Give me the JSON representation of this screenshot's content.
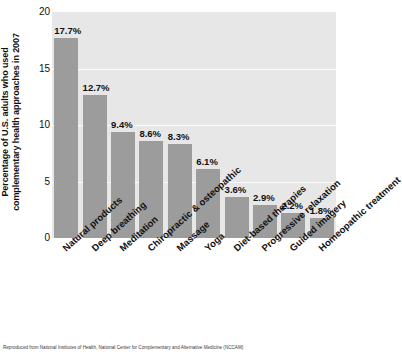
{
  "chart_data": {
    "type": "bar",
    "title": "",
    "subtitle": "",
    "xlabel": "",
    "ylabel_line1": "Percentage of U.S. adults who used",
    "ylabel_line2": "complementary health approaches in 2007",
    "ylim": [
      0,
      20
    ],
    "yticks": [
      0,
      5,
      10,
      15,
      20
    ],
    "ytick_labels": [
      "0",
      "5",
      "10",
      "15",
      "20"
    ],
    "grid": "horizontal-white-gridlines",
    "legend": "none",
    "orientation": "vertical",
    "bar_color": "#9c9c9c",
    "plot_background": "#e7e7e7",
    "categories": [
      "Natural products",
      "Deep breathing",
      "Meditation",
      "Chiropractic & osteopathic",
      "Massage",
      "Yoga",
      "Diet-based therapies",
      "Progressive relaxation",
      "Guided imagery",
      "Homeopathic treatment"
    ],
    "values": [
      17.7,
      12.7,
      9.4,
      8.6,
      8.3,
      6.1,
      3.6,
      2.9,
      2.2,
      1.8
    ],
    "value_labels": [
      "17.7%",
      "12.7%",
      "9.4%",
      "8.6%",
      "8.3%",
      "6.1%",
      "3.6%",
      "2.9%",
      "2.2%",
      "1.8%"
    ]
  },
  "caption": {
    "source": "Reproduced from National Institutes of Health, National Center for Complementary and Alternative Medicine (NCCAM)"
  }
}
